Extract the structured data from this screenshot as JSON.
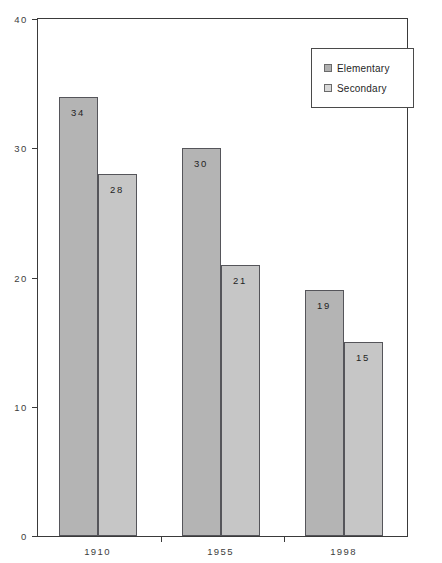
{
  "chart_data": {
    "type": "bar",
    "title": "",
    "xlabel": "",
    "ylabel": "",
    "categories": [
      "1910",
      "1955",
      "1998"
    ],
    "ylim": [
      0,
      40
    ],
    "yticks": [
      0,
      10,
      20,
      30,
      40
    ],
    "ytick_labels": [
      "0",
      "10",
      "20",
      "30",
      "40"
    ],
    "grid": false,
    "legend_position": "top-right",
    "series": [
      {
        "name": "Elementary",
        "color": "#b4b4b4",
        "values": [
          34,
          30,
          19
        ],
        "value_labels": [
          "34",
          "30",
          "19"
        ]
      },
      {
        "name": "Secondary",
        "color": "#c6c6c6",
        "values": [
          28,
          21,
          15
        ],
        "value_labels": [
          "28",
          "21",
          "15"
        ]
      }
    ]
  },
  "legend": {
    "entries": [
      {
        "label": "Elementary",
        "swatch": "legend-swatch-elementary"
      },
      {
        "label": "Secondary",
        "swatch": "legend-swatch-secondary"
      }
    ]
  },
  "axes": {
    "y_tick_labels": [
      "40",
      "30",
      "20",
      "10",
      "0"
    ],
    "x_tick_labels": [
      "1910",
      "1955",
      "1998"
    ]
  }
}
